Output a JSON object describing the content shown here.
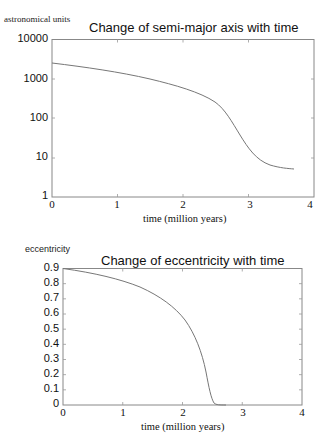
{
  "chart_data": [
    {
      "type": "line",
      "title": "Change of semi-major axis with time",
      "ylabel": "astronomical units",
      "xlabel": "time (million years)",
      "yscale": "log",
      "ylim": [
        1,
        10000
      ],
      "xlim": [
        0,
        4
      ],
      "x_ticks": [
        "0",
        "1",
        "2",
        "3",
        "4"
      ],
      "y_ticks": [
        "10000",
        "1000",
        "100",
        "10",
        "1"
      ],
      "grid": false,
      "series": [
        {
          "name": "semi-major axis",
          "x": [
            0,
            0.5,
            1.0,
            1.5,
            2.0,
            2.25,
            2.5,
            2.65,
            2.75,
            2.85,
            3.0,
            3.15,
            3.3,
            3.5,
            3.7
          ],
          "y": [
            2500,
            2000,
            1500,
            1000,
            600,
            420,
            250,
            150,
            80,
            40,
            20,
            11,
            8,
            6,
            5
          ]
        }
      ]
    },
    {
      "type": "line",
      "title": "Change of eccentricity with time",
      "ylabel": "eccentricity",
      "xlabel": "time (million years)",
      "yscale": "linear",
      "ylim": [
        0,
        0.9
      ],
      "xlim": [
        0,
        4
      ],
      "x_ticks": [
        "0",
        "1",
        "2",
        "3",
        "4"
      ],
      "y_ticks": [
        "0.9",
        "0.8",
        "0.7",
        "0.6",
        "0.5",
        "0.4",
        "0.3",
        "0.2",
        "0.1",
        "0"
      ],
      "grid": false,
      "series": [
        {
          "name": "eccentricity",
          "x": [
            0,
            0.5,
            1.0,
            1.5,
            1.75,
            2.0,
            2.15,
            2.25,
            2.35,
            2.42,
            2.48,
            2.52,
            2.6,
            2.7
          ],
          "y": [
            0.9,
            0.87,
            0.83,
            0.74,
            0.67,
            0.57,
            0.48,
            0.4,
            0.28,
            0.15,
            0.05,
            0.01,
            0.0,
            0.0
          ]
        }
      ]
    }
  ]
}
